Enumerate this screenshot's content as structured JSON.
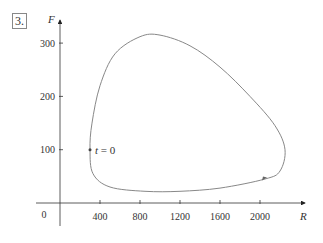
{
  "problem_number": "3.",
  "chart_data": {
    "type": "line",
    "subtype": "parametric phase-plane curve (closed loop)",
    "title": "",
    "xlabel": "R",
    "ylabel": "F",
    "xlim": [
      0,
      2400
    ],
    "ylim": [
      0,
      330
    ],
    "x_ticks": [
      400,
      800,
      1200,
      1600,
      2000
    ],
    "y_ticks": [
      100,
      200,
      300
    ],
    "origin_label": "0",
    "grid": false,
    "legend": null,
    "annotations": [
      {
        "text": "t = 0",
        "point": {
          "R": 300,
          "F": 100
        }
      },
      {
        "text": "direction arrow",
        "point": {
          "R": 2050,
          "F": 45
        }
      }
    ],
    "series": [
      {
        "name": "trajectory",
        "points": [
          {
            "R": 300,
            "F": 100
          },
          {
            "R": 320,
            "F": 150
          },
          {
            "R": 400,
            "F": 220
          },
          {
            "R": 550,
            "F": 280
          },
          {
            "R": 800,
            "F": 312
          },
          {
            "R": 1000,
            "F": 315
          },
          {
            "R": 1300,
            "F": 295
          },
          {
            "R": 1600,
            "F": 255
          },
          {
            "R": 1900,
            "F": 200
          },
          {
            "R": 2150,
            "F": 145
          },
          {
            "R": 2250,
            "F": 100
          },
          {
            "R": 2200,
            "F": 60
          },
          {
            "R": 2050,
            "F": 45
          },
          {
            "R": 1600,
            "F": 28
          },
          {
            "R": 1200,
            "F": 22
          },
          {
            "R": 850,
            "F": 22
          },
          {
            "R": 500,
            "F": 30
          },
          {
            "R": 330,
            "F": 55
          },
          {
            "R": 300,
            "F": 100
          }
        ]
      }
    ]
  }
}
